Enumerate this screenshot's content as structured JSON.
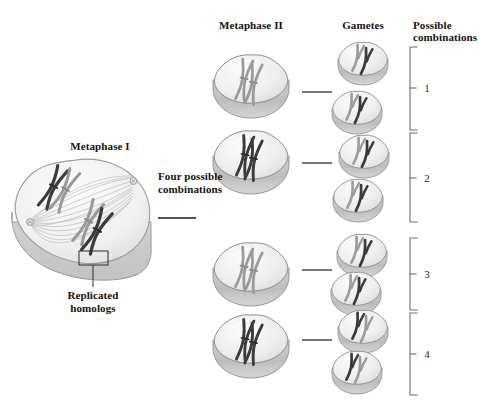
{
  "figure": {
    "type": "biology-diagram",
    "background_color": "#ffffff"
  },
  "headers": {
    "metaphase1": "Metaphase I",
    "metaphase2": "Metaphase II",
    "gametes": "Gametes",
    "possible_line1": "Possible",
    "possible_line2": "combinations"
  },
  "annotations": {
    "four_possible_line1": "Four possible",
    "four_possible_line2": "combinations",
    "replicated_line1": "Replicated",
    "replicated_line2": "homologs"
  },
  "combination_numbers": [
    "1",
    "2",
    "3",
    "4"
  ],
  "colors": {
    "chromosome_dark": "#3b3b3b",
    "chromosome_light": "#9a9a9a",
    "cell_fill": "#eeeeee",
    "cell_edge": "#8d8d8d",
    "cell_shadow": "#c9c9c9",
    "spindle": "#b4b4b4",
    "text": "#15120f",
    "arrow": "#1b1b1b",
    "bracket": "#6e6e6e"
  },
  "metaphase2_cells": [
    {
      "id": "m2-1",
      "chromosome_shading": "light-and-outline"
    },
    {
      "id": "m2-2",
      "chromosome_shading": "dark"
    },
    {
      "id": "m2-3",
      "chromosome_shading": "light-and-outline"
    },
    {
      "id": "m2-4",
      "chromosome_shading": "dark"
    }
  ],
  "gamete_cells": [
    {
      "id": "g-1",
      "group": "1"
    },
    {
      "id": "g-2",
      "group": "1"
    },
    {
      "id": "g-3",
      "group": "2"
    },
    {
      "id": "g-4",
      "group": "2"
    },
    {
      "id": "g-5",
      "group": "3"
    },
    {
      "id": "g-6",
      "group": "3"
    },
    {
      "id": "g-7",
      "group": "4"
    },
    {
      "id": "g-8",
      "group": "4"
    }
  ]
}
